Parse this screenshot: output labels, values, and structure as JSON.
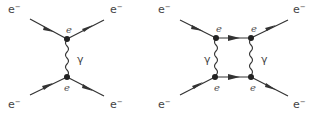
{
  "diagrams": [
    {
      "name": "single-photon-exchange",
      "external_labels": {
        "top_left": "e",
        "top_right": "e",
        "bottom_left": "e",
        "bottom_right": "e",
        "charge": "−"
      },
      "vertex_labels": {
        "top": "e",
        "bottom": "e"
      },
      "propagator_label": "γ"
    },
    {
      "name": "box-two-photon-exchange",
      "external_labels": {
        "top_left": "e",
        "top_right": "e",
        "bottom_left": "e",
        "bottom_right": "e",
        "charge": "−"
      },
      "vertex_labels": {
        "top_left": "e",
        "top_right": "e",
        "bottom_left": "e",
        "bottom_right": "e"
      },
      "propagator_labels": {
        "left": "γ",
        "right": "γ"
      }
    }
  ],
  "colors": {
    "line": "#333333",
    "text": "#444444"
  }
}
